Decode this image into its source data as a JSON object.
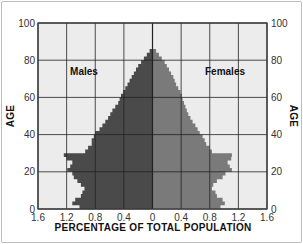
{
  "chart_data": {
    "type": "bar",
    "subtype": "population-pyramid",
    "title": "",
    "xlabel": "PERCENTAGE OF TOTAL POPULATION",
    "ylabel": "AGE",
    "ylabel_right": "AGE",
    "x_ticks": [
      "1.6",
      "1.2",
      "0.8",
      "0.4",
      "0",
      "0.4",
      "0.8",
      "1.2",
      "1.6"
    ],
    "y_ticks": [
      "0",
      "20",
      "40",
      "60",
      "80",
      "100"
    ],
    "xlim": [
      -1.6,
      1.6
    ],
    "ylim": [
      0,
      100
    ],
    "grid": true,
    "legend": [
      {
        "name": "Males",
        "color": "#4a4a4a",
        "side": "left"
      },
      {
        "name": "Females",
        "color": "#7a7a7a",
        "side": "right"
      }
    ],
    "ages": [
      0,
      2,
      4,
      6,
      8,
      10,
      12,
      14,
      16,
      18,
      20,
      22,
      24,
      26,
      28,
      30,
      32,
      34,
      36,
      38,
      40,
      42,
      44,
      46,
      48,
      50,
      52,
      54,
      56,
      58,
      60,
      62,
      64,
      66,
      68,
      70,
      72,
      74,
      76,
      78,
      80,
      82,
      84,
      86
    ],
    "series": [
      {
        "name": "Males",
        "values": [
          1.02,
          1.12,
          1.08,
          1.0,
          0.98,
          0.95,
          1.0,
          1.05,
          1.1,
          1.12,
          1.19,
          1.15,
          1.12,
          1.2,
          1.24,
          0.94,
          0.9,
          0.85,
          0.85,
          0.82,
          0.8,
          0.74,
          0.7,
          0.66,
          0.62,
          0.59,
          0.56,
          0.52,
          0.48,
          0.46,
          0.44,
          0.41,
          0.38,
          0.35,
          0.32,
          0.29,
          0.26,
          0.23,
          0.2,
          0.16,
          0.12,
          0.08,
          0.04,
          0.0
        ]
      },
      {
        "name": "Females",
        "values": [
          0.95,
          1.01,
          0.98,
          0.9,
          0.88,
          0.83,
          0.85,
          0.9,
          0.98,
          1.02,
          1.11,
          1.08,
          1.05,
          1.1,
          1.11,
          0.83,
          0.8,
          0.75,
          0.73,
          0.7,
          0.66,
          0.63,
          0.6,
          0.56,
          0.53,
          0.5,
          0.48,
          0.46,
          0.44,
          0.42,
          0.41,
          0.39,
          0.36,
          0.33,
          0.31,
          0.29,
          0.26,
          0.23,
          0.2,
          0.17,
          0.13,
          0.09,
          0.05,
          0.0
        ]
      }
    ]
  },
  "labels": {
    "males": "Males",
    "females": "Females",
    "x_axis": "PERCENTAGE OF TOTAL POPULATION",
    "y_axis_left": "AGE",
    "y_axis_right": "AGE"
  }
}
